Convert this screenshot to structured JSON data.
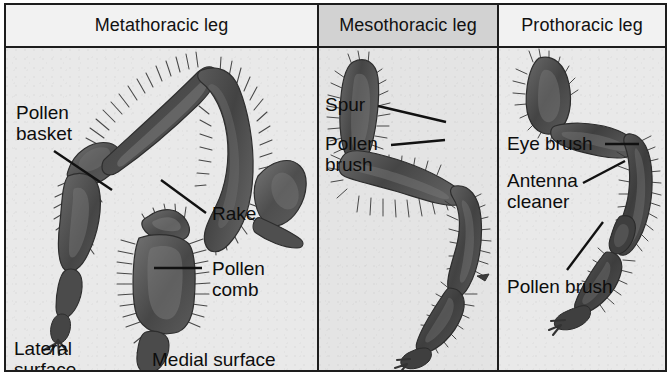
{
  "figure": {
    "type": "anatomical-diagram",
    "panel_count": 3
  },
  "headers": [
    {
      "label": "Metathoracic leg",
      "key": "metathoracic"
    },
    {
      "label": "Mesothoracic leg",
      "key": "mesothoracic"
    },
    {
      "label": "Prothoracic leg",
      "key": "prothoracic"
    }
  ],
  "panels": {
    "metathoracic": {
      "labels": [
        {
          "text": "Pollen\nbasket",
          "name": "pollen-basket"
        },
        {
          "text": "Rake",
          "name": "rake"
        },
        {
          "text": "Pollen\ncomb",
          "name": "pollen-comb"
        },
        {
          "text": "Lateral\nsurface",
          "name": "lateral-surface"
        },
        {
          "text": "Medial surface",
          "name": "medial-surface"
        }
      ]
    },
    "mesothoracic": {
      "labels": [
        {
          "text": "Spur",
          "name": "spur"
        },
        {
          "text": "Pollen\nbrush",
          "name": "pollen-brush"
        }
      ]
    },
    "prothoracic": {
      "labels": [
        {
          "text": "Eye brush",
          "name": "eye-brush"
        },
        {
          "text": "Antenna\ncleaner",
          "name": "antenna-cleaner"
        },
        {
          "text": "Pollen brush",
          "name": "pollen-brush"
        }
      ]
    }
  },
  "colors": {
    "border": "#1d1d1d",
    "header_light": "#f2f2f2",
    "header_shaded": "#d2d2d2",
    "panel_bg": "#e9e9e9",
    "panel_bg_shaded": "#e4e4e4",
    "segment_dark": "#4a4a4a",
    "segment_mid": "#5e5e5e",
    "segment_light": "#747474",
    "text": "#0d0d0d"
  }
}
